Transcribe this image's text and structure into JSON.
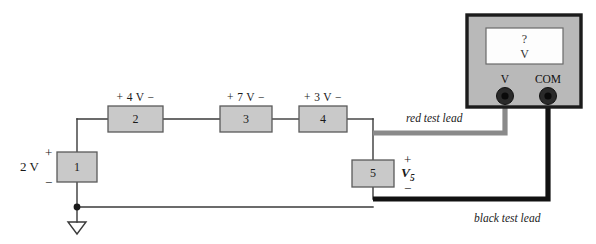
{
  "figure": {
    "type": "circuit-schematic"
  },
  "source": {
    "box_label": "1",
    "value": "2 V",
    "plus": "+",
    "minus": "−"
  },
  "elements": [
    {
      "box_label": "2",
      "drop_label": "+ 4 V −"
    },
    {
      "box_label": "3",
      "drop_label": "+ 7 V −"
    },
    {
      "box_label": "4",
      "drop_label": "+ 3 V −"
    }
  ],
  "measured": {
    "box_label": "5",
    "symbol": "V",
    "subscript": "5",
    "plus": "+",
    "minus": "−"
  },
  "meter": {
    "display_line1": "?",
    "display_line2": "V",
    "terminal_v": "V",
    "terminal_com": "COM"
  },
  "leads": {
    "red": "red test lead",
    "black": "black test lead"
  },
  "ground": {
    "name": "ground-symbol"
  },
  "colors": {
    "box_fill": "#c9c9c9",
    "box_stroke": "#5a5a5a",
    "wire": "#3a3a3a",
    "red_lead": "#8a8a8a",
    "black_lead": "#111111",
    "meter_body": "#b9b9b9",
    "meter_border": "#1b1b1b",
    "display_fill": "#fdfdfd"
  }
}
